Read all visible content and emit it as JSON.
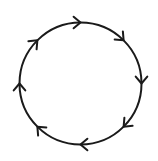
{
  "diagram": {
    "type": "directed-cycle",
    "direction": "clockwise",
    "circle": {
      "cx": 80.5,
      "cy": 83.5,
      "r": 61
    },
    "arrow_count": 8,
    "arrow_angles_deg": [
      -90,
      -45,
      0,
      45,
      90,
      135,
      180,
      225
    ],
    "stroke_color": "#1a1a1a",
    "background_color": "#ffffff",
    "stroke_width": 2
  }
}
